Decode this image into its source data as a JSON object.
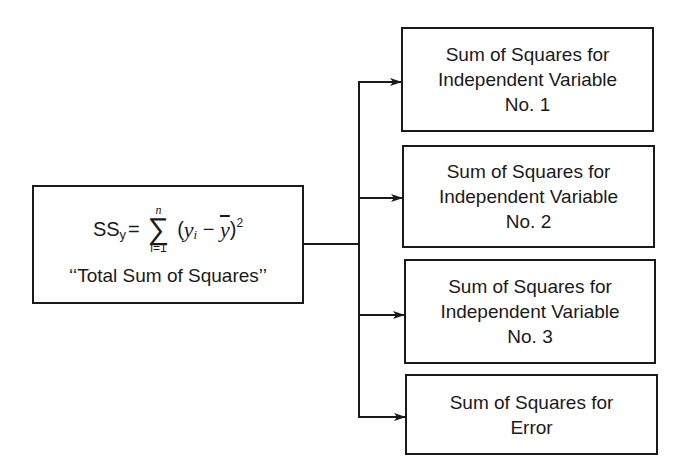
{
  "diagram": {
    "source_box": {
      "formula": {
        "lhs": "SS",
        "lhs_sub": "y",
        "equals": "=",
        "sum_symbol": "∑",
        "sum_upper": "n",
        "sum_lower": "i=1",
        "term_open": "(",
        "term_y": "y",
        "term_y_sub": "i",
        "term_minus": " − ",
        "term_ybar": "y",
        "term_close": ")",
        "exponent": "2"
      },
      "caption": "‘‘Total Sum of Squares’’"
    },
    "target_boxes": [
      {
        "line1": "Sum of Squares for",
        "line2": "Independent Variable",
        "line3": "No. 1"
      },
      {
        "line1": "Sum of Squares for",
        "line2": "Independent Variable",
        "line3": "No. 2"
      },
      {
        "line1": "Sum of Squares for",
        "line2": "Independent Variable",
        "line3": "No. 3"
      },
      {
        "line1": "Sum of Squares for",
        "line2": "Error",
        "line3": ""
      }
    ],
    "colors": {
      "stroke": "#1a1a1a",
      "background": "#ffffff"
    }
  }
}
